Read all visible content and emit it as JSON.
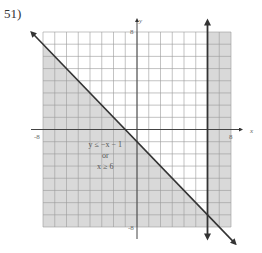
{
  "problem": {
    "number": "51)"
  },
  "chart_data": {
    "type": "inequality-graph",
    "title": "",
    "xlabel": "x",
    "ylabel": "y",
    "xlim": [
      -8,
      8
    ],
    "ylim": [
      -8,
      8
    ],
    "grid": true,
    "grid_step": 1,
    "tick_labels": {
      "x_min": "-8",
      "x_max": "8",
      "y_min": "-8",
      "y_max": "8"
    },
    "boundaries": [
      {
        "kind": "line",
        "equation": "y = -x - 1",
        "slope": -1,
        "intercept": -1,
        "style": "solid"
      },
      {
        "kind": "vertical",
        "equation": "x = 6",
        "x": 6,
        "style": "solid"
      }
    ],
    "shaded_region": "y <= -x - 1 OR x >= 6",
    "annotation": {
      "line1": "y ≤ −x − 1",
      "line2": "or",
      "line3": "x ≥ 6"
    },
    "colors": {
      "shade": "#d9d9d9",
      "grid": "#9a9a9a",
      "axes": "#444444",
      "boundary": "#333333"
    }
  }
}
